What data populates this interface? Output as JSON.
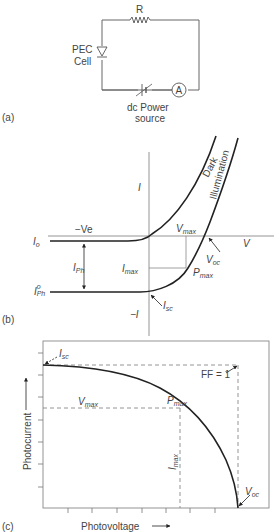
{
  "panel_a": {
    "tag": "(a)",
    "resistor_label": "R",
    "cell_label_line1": "PEC",
    "cell_label_line2": "Cell",
    "ammeter_label": "A",
    "source_label_line1": "dc Power",
    "source_label_line2": "source"
  },
  "panel_b": {
    "tag": "(b)",
    "y_axis_pos": "I",
    "y_axis_neg": "−I",
    "x_axis": "V",
    "neg_voltage": "−Ve",
    "dark_label": "Dark",
    "illum_label": "Illumination",
    "i0": {
      "main": "I",
      "sub": "o"
    },
    "iph": {
      "main": "I",
      "sub": "Ph"
    },
    "iph0": {
      "main": "I",
      "sup": "o",
      "sub": "Ph"
    },
    "imax": {
      "main": "I",
      "sub": "max"
    },
    "vmax": {
      "main": "V",
      "sub": "max"
    },
    "voc": {
      "main": "V",
      "sub": "oc"
    },
    "pmax": {
      "main": "P",
      "sub": "max"
    },
    "isc": {
      "main": "I",
      "sub": "sc"
    }
  },
  "panel_c": {
    "tag": "(c)",
    "x_label": "Photovoltage",
    "y_label": "Photocurrent",
    "isc": {
      "main": "I",
      "sub": "sc"
    },
    "ff": "FF = 1",
    "vmax": {
      "main": "V",
      "sub": "max"
    },
    "pmax": {
      "main": "P",
      "sub": "max"
    },
    "imax": {
      "main": "I",
      "sub": "max"
    },
    "voc": {
      "main": "V",
      "sub": "oc"
    }
  },
  "colors": {
    "line": "#222222",
    "axis": "#888888",
    "dash": "#888888",
    "text": "#444444"
  }
}
